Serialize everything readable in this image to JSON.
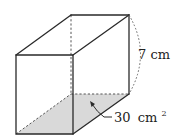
{
  "diagram": {
    "type": "rectangular-prism",
    "colors": {
      "edge": "#2a2a2a",
      "base_fill": "#d9d9d9",
      "background": "#ffffff"
    },
    "labels": {
      "height": {
        "value": "7",
        "unit": "cm",
        "text": "7 cm"
      },
      "base_area": {
        "value": "30",
        "unit": "cm",
        "superscript": "2",
        "text": "30 cm²"
      }
    }
  }
}
